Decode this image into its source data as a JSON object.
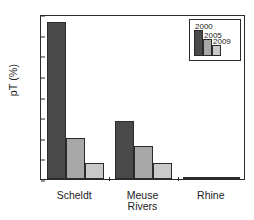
{
  "chart_data": {
    "type": "bar",
    "title": "",
    "xlabel": "Rivers",
    "ylabel": "pT (%)",
    "categories": [
      "Scheldt",
      "Meuse",
      "Rhine"
    ],
    "series": [
      {
        "name": "2000",
        "values": [
          3.8,
          1.4,
          0.02
        ],
        "color": "#4a4a4a"
      },
      {
        "name": "2005",
        "values": [
          1.0,
          0.8,
          0.02
        ],
        "color": "#a8a8a8"
      },
      {
        "name": "2009",
        "values": [
          0.4,
          0.4,
          0.02
        ],
        "color": "#c9c9c9"
      }
    ],
    "ylim": [
      0.0,
      4.0
    ],
    "yticks": [
      "0.0",
      "0.5",
      "1.0",
      "1.5",
      "2.0",
      "2.5",
      "3.0",
      "3.5",
      "4.0"
    ],
    "ytick_values": [
      0.0,
      0.5,
      1.0,
      1.5,
      2.0,
      2.5,
      3.0,
      3.5,
      4.0
    ],
    "grid": false,
    "legend_position": "top-right",
    "legend_entries": [
      "2000",
      "2005",
      "2009"
    ]
  },
  "axes": {
    "y_title": "pT (%)",
    "x_title": "Rivers"
  }
}
